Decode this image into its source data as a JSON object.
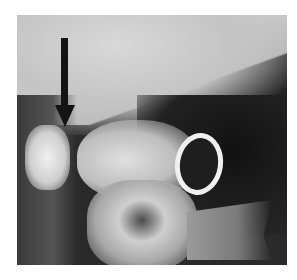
{
  "image": {
    "description": "Lateral radiograph of the upper cervical spine / craniovertebral junction with a black arrow pointing downward to the region near the dens",
    "annotation": {
      "type": "arrow",
      "direction": "down",
      "color": "#141414"
    }
  }
}
